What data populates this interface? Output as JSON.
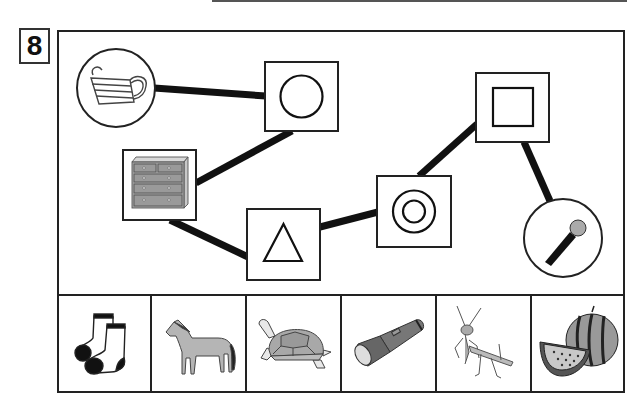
{
  "question": {
    "number": "8"
  },
  "puzzle": {
    "type": "shape-path-connection",
    "nodes": [
      {
        "id": "mask",
        "kind": "picture",
        "label": "face mask",
        "frame": "circle"
      },
      {
        "id": "circle",
        "kind": "shape",
        "label": "circle",
        "frame": "square"
      },
      {
        "id": "dresser",
        "kind": "picture",
        "label": "chest of drawers",
        "frame": "square"
      },
      {
        "id": "triangle",
        "kind": "shape",
        "label": "triangle",
        "frame": "square"
      },
      {
        "id": "double-circle",
        "kind": "shape",
        "label": "double circle",
        "frame": "square"
      },
      {
        "id": "square",
        "kind": "shape",
        "label": "square",
        "frame": "square"
      },
      {
        "id": "microphone",
        "kind": "picture",
        "label": "microphone",
        "frame": "circle"
      }
    ],
    "edges": [
      [
        "mask",
        "circle"
      ],
      [
        "circle",
        "dresser"
      ],
      [
        "dresser",
        "triangle"
      ],
      [
        "triangle",
        "double-circle"
      ],
      [
        "double-circle",
        "square"
      ],
      [
        "square",
        "microphone"
      ]
    ]
  },
  "answer_choices": [
    {
      "label": "socks"
    },
    {
      "label": "horse"
    },
    {
      "label": "tortoise"
    },
    {
      "label": "flashlight"
    },
    {
      "label": "praying mantis"
    },
    {
      "label": "watermelon"
    }
  ],
  "colors": {
    "line": "#111111",
    "frame": "#222222",
    "fill_gray": "#9a9a9a"
  }
}
